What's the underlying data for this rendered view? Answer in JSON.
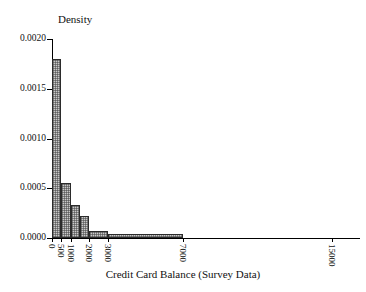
{
  "chart_data": {
    "type": "bar",
    "title": "",
    "subtitle": "",
    "xlabel": "Credit Card Balance (Survey Data)",
    "ylabel": "Density",
    "grid": false,
    "legend": null,
    "xlim": [
      0,
      16500
    ],
    "ylim": [
      0.0,
      0.002
    ],
    "x_tick_values": [
      0,
      500,
      1000,
      2000,
      3000,
      7000,
      15000
    ],
    "x_tick_labels": [
      "0",
      "500",
      "1000",
      "2000",
      "3000",
      "7000",
      "15000"
    ],
    "x_tick_rotation": 90,
    "y_tick_values": [
      0.0,
      0.0005,
      0.001,
      0.0015,
      0.002
    ],
    "y_tick_labels": [
      "0.0000",
      "0.0005",
      "0.0010",
      "0.0015",
      "0.0020"
    ],
    "bin_edges": [
      0,
      500,
      1000,
      1500,
      2000,
      3000,
      7000
    ],
    "bars": [
      {
        "bin_start": 0,
        "bin_end": 500,
        "density": 0.0018
      },
      {
        "bin_start": 500,
        "bin_end": 1000,
        "density": 0.00055
      },
      {
        "bin_start": 1000,
        "bin_end": 1500,
        "density": 0.00033
      },
      {
        "bin_start": 1500,
        "bin_end": 2000,
        "density": 0.00022
      },
      {
        "bin_start": 2000,
        "bin_end": 3000,
        "density": 7e-05
      },
      {
        "bin_start": 3000,
        "bin_end": 7000,
        "density": 4e-05
      }
    ],
    "values": [
      0.0018,
      0.00055,
      0.00033,
      0.00022,
      7e-05,
      4e-05
    ],
    "categories": [
      "0-500",
      "500-1000",
      "1000-1500",
      "1500-2000",
      "2000-3000",
      "3000-7000"
    ],
    "colors": {
      "bar_fill": "#c9c9c9",
      "bar_hatch": "#464646",
      "bar_edge": "#2b2b2b",
      "axis": "#000000",
      "text": "#111111",
      "background": "#ffffff"
    }
  }
}
